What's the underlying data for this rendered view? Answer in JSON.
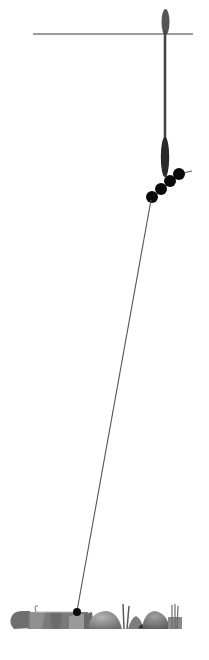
{
  "diagram": {
    "type": "fishing-float-rig",
    "title": "",
    "labels": [],
    "colors": {
      "background": "#ffffff",
      "water_surface": "#3a3a3a",
      "float": "#4a4a4a",
      "shot": "#0a0a0a",
      "line": "#555555",
      "stone_dark": "#6e6e6e",
      "stone_mid": "#8c8c8c",
      "stone_light": "#a8a8a8",
      "weed": "#5a5a5a"
    },
    "water_surface": {
      "x1": 33,
      "x2": 193,
      "y": 34
    },
    "float": {
      "x": 165,
      "tip_top": 9,
      "tip_bottom": 36,
      "stem_bottom": 140,
      "body_top": 137,
      "body_bottom": 176
    },
    "shots": [
      {
        "cx": 152,
        "cy": 197,
        "r": 6
      },
      {
        "cx": 161,
        "cy": 189,
        "r": 6
      },
      {
        "cx": 170,
        "cy": 181,
        "r": 6
      },
      {
        "cx": 179,
        "cy": 174,
        "r": 6
      }
    ],
    "main_line": {
      "x1": 151,
      "y1": 200,
      "x2": 77,
      "y2": 611
    },
    "bottom_shot": {
      "cx": 77,
      "cy": 612,
      "r": 4
    },
    "hook_link": {
      "x1": 35,
      "x2": 77,
      "y": 612
    },
    "lakebed_y": 630
  }
}
